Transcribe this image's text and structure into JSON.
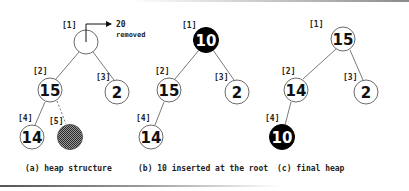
{
  "colors": {
    "node_stroke": "#6a6a6a",
    "edge": "#7a7a7a",
    "highlight_fill": "#000000",
    "highlight_text": "#ffffff",
    "text": "#111111"
  },
  "panels": {
    "a": {
      "caption": "(a) heap structure",
      "removed_value": "20",
      "removed_label": "removed",
      "nodes": [
        {
          "index": "[1]",
          "value": ""
        },
        {
          "index": "[2]",
          "value": "15"
        },
        {
          "index": "[3]",
          "value": "2"
        },
        {
          "index": "[4]",
          "value": "14"
        },
        {
          "index": "[5]",
          "value": "",
          "style": "hatched"
        }
      ]
    },
    "b": {
      "caption": "(b) 10 inserted at the root",
      "nodes": [
        {
          "index": "[1]",
          "value": "10",
          "style": "black"
        },
        {
          "index": "[2]",
          "value": "15"
        },
        {
          "index": "[3]",
          "value": "2"
        },
        {
          "index": "[4]",
          "value": "14"
        }
      ]
    },
    "c": {
      "caption": "(c) final heap",
      "nodes": [
        {
          "index": "[1]",
          "value": "15"
        },
        {
          "index": "[2]",
          "value": "14"
        },
        {
          "index": "[3]",
          "value": "2"
        },
        {
          "index": "[4]",
          "value": "10",
          "style": "black"
        }
      ]
    }
  }
}
